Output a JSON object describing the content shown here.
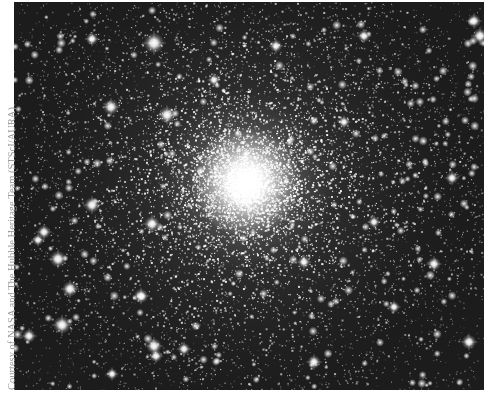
{
  "figure": {
    "alt": "Globular star cluster photograph",
    "credit": "Courtesy of NASA and The Hubble Heritage Team (STScI/AURA)"
  },
  "render": {
    "background_color": "#1c1c1c",
    "star_color": "#ffffff",
    "credit_color": "#9a9a9a",
    "core_center": {
      "x": 232,
      "y": 180
    },
    "core_radius": 55,
    "halo_radius": 260,
    "seed": 48271,
    "star_count": 9000,
    "bright_stars": [
      {
        "x": 140,
        "y": 41,
        "r": 4.0
      },
      {
        "x": 97,
        "y": 105,
        "r": 3.0
      },
      {
        "x": 78,
        "y": 37,
        "r": 2.4
      },
      {
        "x": 153,
        "y": 113,
        "r": 3.2
      },
      {
        "x": 78,
        "y": 203,
        "r": 3.0
      },
      {
        "x": 30,
        "y": 230,
        "r": 2.6
      },
      {
        "x": 24,
        "y": 238,
        "r": 2.2
      },
      {
        "x": 44,
        "y": 257,
        "r": 3.2
      },
      {
        "x": 56,
        "y": 287,
        "r": 3.0
      },
      {
        "x": 48,
        "y": 323,
        "r": 3.4
      },
      {
        "x": 15,
        "y": 334,
        "r": 2.6
      },
      {
        "x": 138,
        "y": 222,
        "r": 3.0
      },
      {
        "x": 127,
        "y": 294,
        "r": 2.8
      },
      {
        "x": 140,
        "y": 344,
        "r": 3.0
      },
      {
        "x": 142,
        "y": 354,
        "r": 2.4
      },
      {
        "x": 460,
        "y": 19,
        "r": 2.6
      },
      {
        "x": 466,
        "y": 34,
        "r": 3.0
      },
      {
        "x": 262,
        "y": 44,
        "r": 2.4
      },
      {
        "x": 350,
        "y": 34,
        "r": 2.4
      },
      {
        "x": 98,
        "y": 372,
        "r": 2.2
      },
      {
        "x": 170,
        "y": 347,
        "r": 2.4
      },
      {
        "x": 300,
        "y": 360,
        "r": 2.6
      },
      {
        "x": 420,
        "y": 262,
        "r": 2.6
      },
      {
        "x": 438,
        "y": 176,
        "r": 2.4
      },
      {
        "x": 380,
        "y": 305,
        "r": 2.2
      },
      {
        "x": 455,
        "y": 340,
        "r": 2.8
      },
      {
        "x": 200,
        "y": 78,
        "r": 2.2
      },
      {
        "x": 330,
        "y": 120,
        "r": 2.2
      },
      {
        "x": 290,
        "y": 260,
        "r": 2.4
      },
      {
        "x": 360,
        "y": 220,
        "r": 2.2
      }
    ]
  }
}
